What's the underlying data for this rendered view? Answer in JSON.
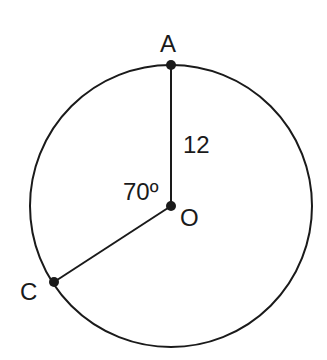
{
  "diagram": {
    "type": "circle-geometry",
    "circle": {
      "cx": 171,
      "cy": 206,
      "r": 141
    },
    "points": {
      "A": {
        "label": "A",
        "x": 171,
        "y": 65
      },
      "O": {
        "label": "O",
        "x": 171,
        "y": 206
      },
      "C": {
        "label": "C",
        "x": 54,
        "y": 282
      }
    },
    "segments": [
      {
        "from": "O",
        "to": "A",
        "length_label": "12"
      },
      {
        "from": "O",
        "to": "C"
      }
    ],
    "angle_label": "70º",
    "colors": {
      "stroke": "#1a1a1a",
      "background": "#ffffff"
    }
  }
}
